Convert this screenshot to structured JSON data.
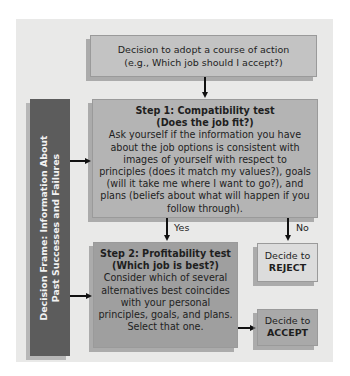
{
  "diagram": {
    "top_box": {
      "line1": "Decision to adopt a course of action",
      "line2": "(e.g., Which job should I accept?)"
    },
    "step1": {
      "title": "Step 1: Compatibility test",
      "subtitle": "(Does the job fit?)",
      "body": "Ask yourself if the information you have about the job options is consistent with images of yourself with respect to principles (does it match my values?), goals (will it take me where I want to go?), and plans (beliefs about what will happen if you follow through)."
    },
    "step2": {
      "title": "Step 2: Profitability test",
      "subtitle": "(Which job is best?)",
      "body": "Consider which of several alternatives best coincides with your personal principles, goals, and plans. Select that one."
    },
    "reject": {
      "line1": "Decide to",
      "line2": "REJECT"
    },
    "accept": {
      "line1": "Decide to",
      "line2": "ACCEPT"
    },
    "decision_frame": {
      "line1": "Decision Frame: Information About",
      "line2": "Past Successes and Failures"
    },
    "edges": {
      "yes_label": "Yes",
      "no_label": "No"
    },
    "colors": {
      "panel": "#e9e9e8",
      "top_box": "#c3c3c3",
      "step1": "#b4b4b4",
      "step2": "#9f9f9f",
      "reject": "#dcdcdc",
      "accept": "#a9a9a9",
      "decision_frame": "#5c5c5c"
    }
  }
}
